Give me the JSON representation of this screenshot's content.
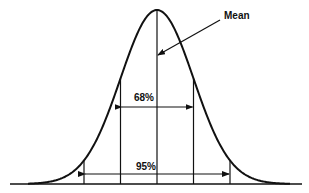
{
  "labels": {
    "mean": "Mean",
    "band_68": "68%",
    "band_95": "95%"
  },
  "geometry": {
    "mean_x": 157,
    "sigma_px": 36.5,
    "baseline_y": 184,
    "peak_y": 10,
    "baseline_x0": 10,
    "baseline_x1": 302,
    "arrow_68_y": 107,
    "arrow_95_y": 174,
    "mean_arrow": {
      "x1": 220,
      "y1": 20,
      "x2": 158,
      "y2": 55
    },
    "mean_label": {
      "x": 224,
      "y": 19
    },
    "label_68": {
      "x": 144,
      "y": 101
    },
    "label_95": {
      "x": 146,
      "y": 170
    }
  },
  "colors": {
    "ink": "#111111",
    "background": "#ffffff"
  }
}
